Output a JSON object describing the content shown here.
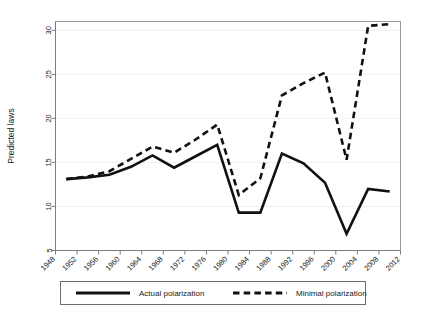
{
  "chart_data": {
    "type": "line",
    "title": "",
    "xlabel": "",
    "ylabel": "Predicted laws",
    "xlim": [
      1948,
      2012
    ],
    "ylim": [
      5,
      31
    ],
    "grid": true,
    "legend_position": "bottom-outside",
    "xticks": [
      1948,
      1952,
      1956,
      1960,
      1964,
      1968,
      1972,
      1976,
      1980,
      1984,
      1988,
      1992,
      1996,
      2000,
      2004,
      2008,
      2012
    ],
    "yticks": [
      5,
      10,
      15,
      20,
      25,
      30
    ],
    "x": [
      1950,
      1954,
      1958,
      1962,
      1966,
      1970,
      1974,
      1978,
      1982,
      1986,
      1990,
      1994,
      1998,
      2002,
      2006,
      2010
    ],
    "series": [
      {
        "name": "Actual polarization",
        "style": "solid",
        "values": [
          13.1,
          13.3,
          13.6,
          14.5,
          15.8,
          14.4,
          15.7,
          17.0,
          9.3,
          9.3,
          16.0,
          14.9,
          12.7,
          6.9,
          12.0,
          11.7
        ]
      },
      {
        "name": "Minimal polarization",
        "style": "dashed",
        "values": [
          13.1,
          13.4,
          14.0,
          15.4,
          16.8,
          16.1,
          17.6,
          19.3,
          11.3,
          13.2,
          22.6,
          24.0,
          25.2,
          15.3,
          30.5,
          30.7
        ]
      }
    ]
  },
  "legend": {
    "entries": [
      {
        "label": "Actual polarization",
        "style": "solid"
      },
      {
        "label": "Minimal polarization",
        "style": "dashed"
      }
    ]
  },
  "colors": {
    "line": "#111111",
    "axis": "#7d7d7d",
    "grid": "#f0f0f0",
    "background": "#ffffff"
  }
}
